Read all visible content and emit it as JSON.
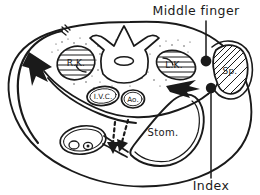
{
  "figure": {
    "background_color": "#ffffff",
    "ink_color": "#1a1a1a",
    "style": "hand-drawn pen and ink line diagram"
  },
  "callouts": [
    {
      "id": "middle-finger",
      "label": "Middle finger",
      "text_x": 196,
      "text_y": 15,
      "leader_from_x": 206,
      "leader_from_y": 21,
      "leader_to_x": 206,
      "leader_to_y": 57,
      "marker_x": 206,
      "marker_y": 61,
      "marker_r": 5.4
    },
    {
      "id": "index",
      "label": "Index",
      "text_x": 196,
      "text_y": 188,
      "leader_from_x": 211,
      "leader_from_y": 178,
      "leader_to_x": 211,
      "leader_to_y": 92,
      "marker_x": 211,
      "marker_y": 88,
      "marker_r": 5.2
    }
  ],
  "organ_labels": [
    {
      "id": "right-kidney",
      "label": "R.K.",
      "x": 76,
      "y": 63,
      "size": "organ-label"
    },
    {
      "id": "left-kidney",
      "label": "L.K.",
      "x": 174,
      "y": 64,
      "size": "organ-label"
    },
    {
      "id": "inferior-vena-cava",
      "label": "I.V.C.",
      "x": 103,
      "y": 97,
      "size": "organ-label-sm"
    },
    {
      "id": "aorta",
      "label": "Ao.",
      "x": 133,
      "y": 100,
      "size": "organ-label-sm"
    },
    {
      "id": "spleen",
      "label": "Sp.",
      "x": 227,
      "y": 71,
      "size": "organ-label"
    },
    {
      "id": "stomach",
      "label": "Stom.",
      "x": 163,
      "y": 133,
      "size": "organ-label-stom"
    }
  ],
  "structures": [
    {
      "id": "body-wall-outline",
      "name": "abdominal body wall cross-section"
    },
    {
      "id": "vertebra",
      "name": "lumbar vertebra with spinous and transverse processes"
    },
    {
      "id": "spinal-canal",
      "name": "vertebral canal"
    },
    {
      "id": "right-kidney-organ",
      "name": "right kidney, horizontally hatched"
    },
    {
      "id": "left-kidney-organ",
      "name": "left kidney, horizontally hatched"
    },
    {
      "id": "spleen-organ",
      "name": "spleen, diagonally hatched"
    },
    {
      "id": "inferior-vena-cava-vessel",
      "name": "inferior vena cava"
    },
    {
      "id": "aorta-vessel",
      "name": "aorta"
    },
    {
      "id": "stomach-organ",
      "name": "stomach lumen"
    },
    {
      "id": "duodenum-organ",
      "name": "small bowel loop with vessels"
    },
    {
      "id": "retroperitoneal-fat",
      "name": "stippled retroperitoneal fat"
    }
  ],
  "arrows": [
    {
      "id": "examiner-hand-arrow",
      "name": "solid hand path arrow entering from left flank",
      "style": "solid-filled"
    },
    {
      "id": "palpation-direction-arrow",
      "name": "solid arrow directed toward spleen",
      "style": "solid-filled"
    },
    {
      "id": "dashed-arrow-left",
      "name": "dashed downward arrow near bowel loop",
      "style": "dashed"
    },
    {
      "id": "dashed-arrow-right",
      "name": "dashed downward arrow toward stomach",
      "style": "dashed"
    }
  ],
  "tick_mark": {
    "id": "flank-tick",
    "name": "small tick mark at left flank entry point"
  }
}
